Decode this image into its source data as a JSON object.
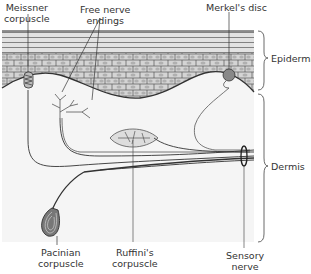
{
  "diagram": {
    "labels": {
      "meissner": [
        "Meissner",
        "corpuscle"
      ],
      "free_nerve": [
        "Free nerve",
        "endings"
      ],
      "merkel": [
        "Merkel's disc"
      ],
      "epidermis": "Epidermis",
      "dermis": "Dermis",
      "pacinian": [
        "Pacinian",
        "corpuscle"
      ],
      "ruffini": [
        "Ruffini's",
        "corpuscle"
      ],
      "sensory_nerve": [
        "Sensory",
        "nerve"
      ]
    },
    "colors": {
      "background": "#ffffff",
      "dermis_fill": "#f4f4f4",
      "stratum_corneum": "#d9d9d9",
      "cell_fill": "#cfcfcf",
      "cell_nucleus": "#b8b8b8",
      "line": "#333333",
      "nerve": "#555555"
    }
  }
}
